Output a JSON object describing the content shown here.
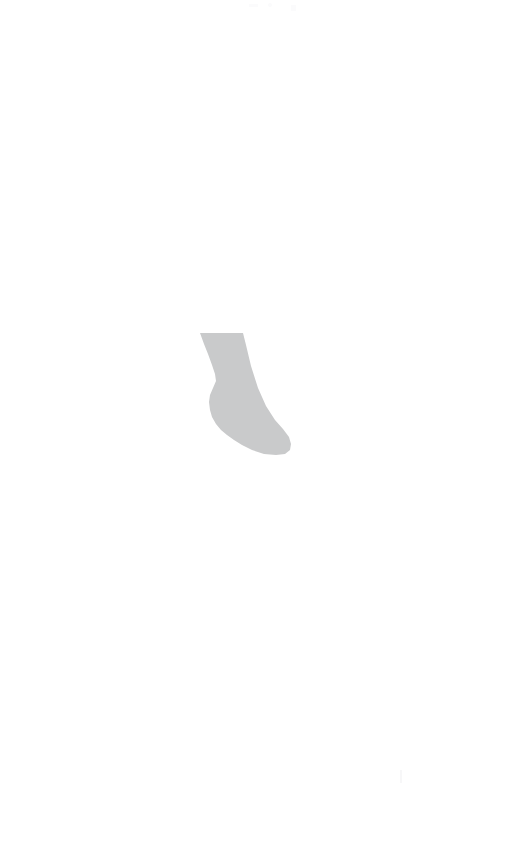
{
  "canvas": {
    "width": 527,
    "height": 844,
    "background_color": "#ffffff",
    "title": "Foot Silhouette"
  },
  "figure": {
    "name": "foot-sock-silhouette",
    "description": "Light gray silhouette of a human foot and lower leg, toes pointing to the lower right",
    "fill_color": "#c9cacb",
    "bounds": {
      "x": 199,
      "y": 332,
      "width": 93,
      "height": 124
    },
    "path": "M 200 333 L 243 333 L 246 345 L 251 366 L 258 388 L 266 406 L 275 420 L 283 429 L 289 437 L 291 444 L 290 450 L 285 454 L 276 455 L 264 454 L 252 450 L 242 445 L 234 440 L 227 435 L 221 430 L 216 424 L 212 417 L 210 410 L 209 402 L 210 395 L 213 388 L 216 381 L 215 374 L 212 365 L 208 354 L 204 344 Z"
  },
  "artifacts": [
    {
      "name": "top-mark-a",
      "note": "faint light mark"
    },
    {
      "name": "top-mark-b",
      "note": "faint light mark"
    },
    {
      "name": "top-mark-c",
      "note": "faint light mark"
    },
    {
      "name": "bottom-right-tick",
      "note": "faint vertical tick"
    }
  ]
}
